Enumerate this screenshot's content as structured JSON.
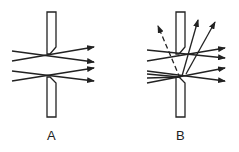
{
  "figure": {
    "panels": [
      {
        "id": "A",
        "label": "A",
        "description": "Light rays passing straight through an ideal slit aperture"
      },
      {
        "id": "B",
        "label": "B",
        "description": "Light rays passing through slit with scattering; some rays reflected/scattered upward, one dashed ray"
      }
    ],
    "colors": {
      "stroke": "#222222",
      "background": "#ffffff"
    }
  }
}
